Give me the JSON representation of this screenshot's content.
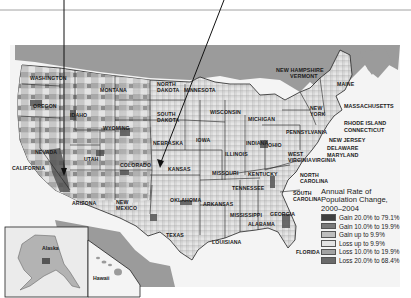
{
  "map": {
    "title": "Annual Rate of Population Change, 2000–2004",
    "legend": {
      "title_lines": [
        "Annual Rate of",
        "Population Change,",
        "2000–2004"
      ],
      "items": [
        {
          "label": "Gain 20.0% to 79.1%",
          "color": "#3f3f3f"
        },
        {
          "label": "Gain 10.0% to 19.9%",
          "color": "#7a7a7a"
        },
        {
          "label": "Gain up to 9.9%",
          "color": "#bdbdbd"
        },
        {
          "label": "Loss up to 9.9%",
          "color": "#e2e2e2"
        },
        {
          "label": "Loss 10.0% to 19.9%",
          "color": "#a3a3a3"
        },
        {
          "label": "Loss 20.0% to 68.4%",
          "color": "#6a6a6a"
        }
      ]
    },
    "state_labels": {
      "washington": "Washington",
      "oregon": "Oregon",
      "california": "California",
      "nevada": "Nevada",
      "idaho": "Idaho",
      "montana": "Montana",
      "wyoming": "Wyoming",
      "utah": "Utah",
      "colorado": "Colorado",
      "arizona": "Arizona",
      "new_mexico_1": "New",
      "new_mexico_2": "Mexico",
      "north_dakota_1": "North",
      "north_dakota_2": "Dakota",
      "south_dakota_1": "South",
      "south_dakota_2": "Dakota",
      "nebraska": "Nebraska",
      "kansas": "Kansas",
      "oklahoma": "Oklahoma",
      "texas": "Texas",
      "minnesota": "Minnesota",
      "iowa": "Iowa",
      "missouri": "Missouri",
      "arkansas": "Arkansas",
      "louisiana": "Louisiana",
      "wisconsin": "Wisconsin",
      "illinois": "Illinois",
      "michigan": "Michigan",
      "indiana": "Indiana",
      "ohio": "Ohio",
      "kentucky": "Kentucky",
      "tennessee": "Tennessee",
      "mississippi": "Mississippi",
      "alabama": "Alabama",
      "georgia": "Georgia",
      "florida": "Florida",
      "south_carolina_1": "South",
      "south_carolina_2": "Carolina",
      "north_carolina_1": "North",
      "north_carolina_2": "Carolina",
      "virginia": "Virginia",
      "west_virginia_1": "West",
      "west_virginia_2": "Virginia",
      "pennsylvania": "Pennsylvania",
      "new_york_1": "New",
      "new_york_2": "York",
      "new_hampshire": "New Hampshire",
      "vermont": "Vermont",
      "maine": "Maine",
      "massachusetts": "Massachusetts",
      "rhode_island": "Rhode Island",
      "connecticut": "Connecticut",
      "new_jersey": "New Jersey",
      "delaware": "Delaware",
      "maryland": "Maryland",
      "alaska": "Alaska",
      "hawaii": "Hawaii"
    }
  }
}
